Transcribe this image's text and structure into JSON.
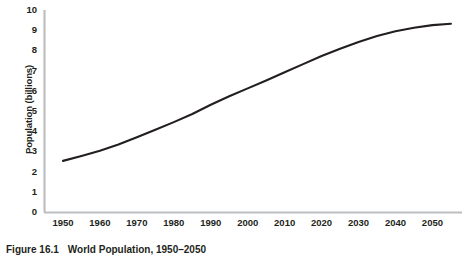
{
  "caption": {
    "label": "Figure 16.1",
    "title": "World Population, 1950–2050"
  },
  "colors": {
    "line": "#231f20",
    "axis": "#bcbec0",
    "text": "#231f20",
    "background": "#ffffff"
  },
  "chart_data": {
    "type": "line",
    "title": "World Population, 1950–2050",
    "xlabel": "",
    "ylabel": "Population (billions)",
    "xlim": [
      1945,
      2058
    ],
    "ylim": [
      0,
      10
    ],
    "grid": false,
    "legend": "none",
    "x_ticks": [
      "1950",
      "1960",
      "1970",
      "1980",
      "1990",
      "2000",
      "2010",
      "2020",
      "2030",
      "2040",
      "2050"
    ],
    "y_ticks": [
      "0",
      "1",
      "2",
      "3",
      "4",
      "5",
      "6",
      "7",
      "8",
      "9",
      "10"
    ],
    "series": [
      {
        "name": "World population",
        "x": [
          1950,
          1955,
          1960,
          1965,
          1970,
          1975,
          1980,
          1985,
          1990,
          1995,
          2000,
          2005,
          2010,
          2015,
          2020,
          2025,
          2030,
          2035,
          2040,
          2045,
          2050,
          2055
        ],
        "values": [
          2.53,
          2.77,
          3.03,
          3.34,
          3.7,
          4.07,
          4.45,
          4.85,
          5.31,
          5.73,
          6.12,
          6.51,
          6.92,
          7.32,
          7.72,
          8.08,
          8.42,
          8.71,
          8.95,
          9.12,
          9.25,
          9.32
        ]
      }
    ]
  }
}
